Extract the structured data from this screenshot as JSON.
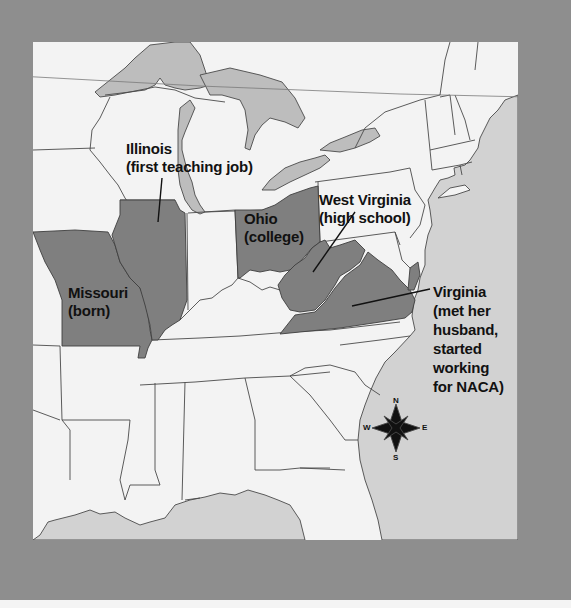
{
  "map": {
    "title": "Katherine Johnson's life locations (eastern United States)",
    "colors": {
      "frame": "#8e8e8e",
      "land": "#f3f3f3",
      "water": "#d2d2d2",
      "highlighted_state": "#7f7f7f",
      "border": "#4a4a4a",
      "label_text": "#111111"
    },
    "highlighted_states": [
      "Missouri",
      "Illinois",
      "Ohio",
      "West Virginia",
      "Virginia"
    ],
    "labels": [
      {
        "id": "illinois",
        "line1": "Illinois",
        "line2": "(first teaching job)"
      },
      {
        "id": "ohio",
        "line1": "Ohio",
        "line2": "(college)"
      },
      {
        "id": "west_virginia",
        "line1": "West Virginia",
        "line2": "(high school)"
      },
      {
        "id": "missouri",
        "line1": "Missouri",
        "line2": "(born)"
      },
      {
        "id": "virginia",
        "line1": "Virginia",
        "line2": "(met her",
        "line3": "husband,",
        "line4": "started",
        "line5": "working",
        "line6": "for NACA)"
      }
    ],
    "compass": {
      "n": "N",
      "s": "S",
      "e": "E",
      "w": "W"
    }
  }
}
